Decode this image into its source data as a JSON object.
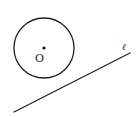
{
  "diagram": {
    "stroke_color": "#222222",
    "background": "#ffffff",
    "circle": {
      "center_label": "O",
      "cx": 44,
      "cy": 48,
      "r": 30
    },
    "center_point": {
      "x": 44,
      "y": 48,
      "r": 1.6
    },
    "line": {
      "label": "ℓ",
      "x1": 14,
      "y1": 112,
      "x2": 130,
      "y2": 53
    },
    "labels": {
      "center": {
        "text": "O",
        "x": 35,
        "y": 62
      },
      "line": {
        "text": "ℓ",
        "x": 122,
        "y": 50
      }
    }
  }
}
